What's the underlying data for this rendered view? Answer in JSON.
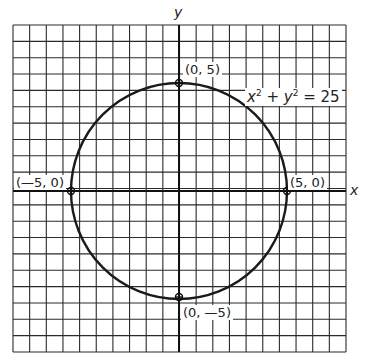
{
  "chart_data": {
    "type": "line",
    "title": "",
    "xlabel": "x",
    "ylabel": "y",
    "grid": true,
    "equation": "x² + y² = 25",
    "curve": {
      "shape": "circle",
      "center": [
        0,
        0
      ],
      "radius": 5
    },
    "points": [
      {
        "label": "(0, 5)",
        "x": 0,
        "y": 5
      },
      {
        "label": "(5, 0)",
        "x": 5,
        "y": 0
      },
      {
        "label": "(−5, 0)",
        "x": -5,
        "y": 0
      },
      {
        "label": "(0, −5)",
        "x": 0,
        "y": -5
      }
    ],
    "colors": {
      "grid": "#2b2b2b",
      "curve": "#1a1a1a",
      "background": "#ffffff"
    }
  },
  "labels": {
    "x_axis": "x",
    "y_axis": "y",
    "eq_x": "x",
    "eq_sq1": "2",
    "eq_plus": " + ",
    "eq_y": "y",
    "eq_sq2": "2",
    "eq_rest": " = 25",
    "p_top": "(0, 5)",
    "p_right": "(5, 0)",
    "p_left": "(—5, 0)",
    "p_bottom": "(0, —5)"
  }
}
